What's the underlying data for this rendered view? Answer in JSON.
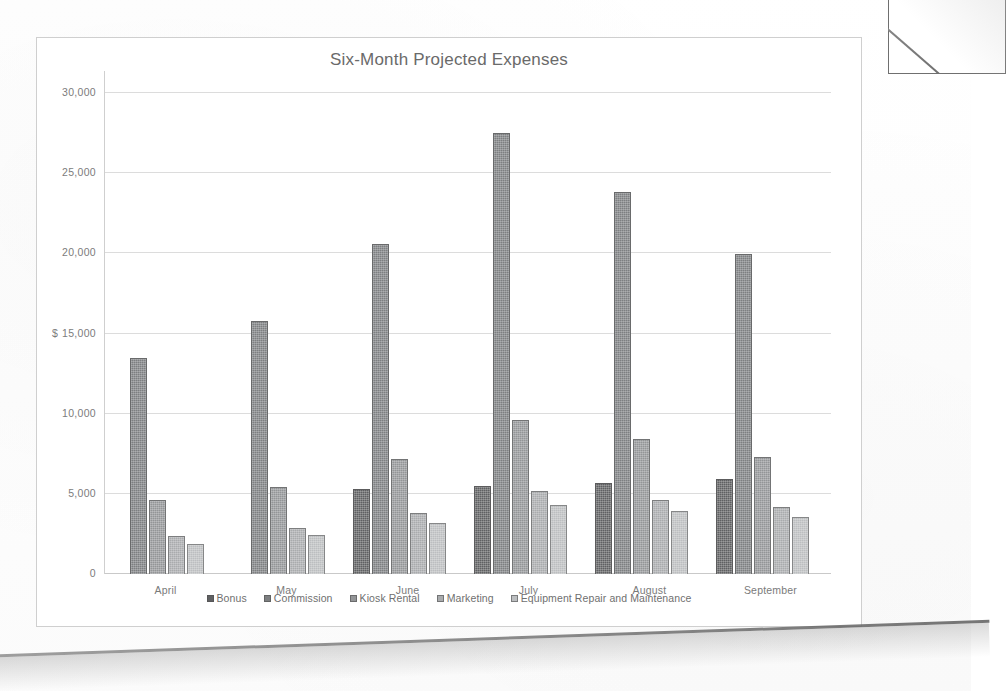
{
  "chart_data": {
    "type": "bar",
    "title": "Six-Month Projected Expenses",
    "xlabel": "",
    "ylabel": "$",
    "ylim": [
      0,
      30000
    ],
    "grid": true,
    "legend_position": "bottom",
    "categories": [
      "April",
      "May",
      "June",
      "July",
      "August",
      "September"
    ],
    "ytick_labels": [
      "0",
      "5,000",
      "10,000",
      "15,000",
      "20,000",
      "25,000",
      "30,000"
    ],
    "ytick_values": [
      0,
      5000,
      10000,
      15000,
      20000,
      25000,
      30000
    ],
    "currency_tick_label": "15,000",
    "currency_symbol": "$",
    "series": [
      {
        "name": "Bonus",
        "values": [
          0,
          0,
          5300,
          5500,
          5700,
          5900
        ]
      },
      {
        "name": "Commission",
        "values": [
          13500,
          15800,
          20600,
          27500,
          23800,
          19950
        ]
      },
      {
        "name": "Kiosk Rental",
        "values": [
          4600,
          5400,
          7150,
          9600,
          8400,
          7300
        ]
      },
      {
        "name": "Marketing",
        "values": [
          2400,
          2900,
          3800,
          5150,
          4600,
          4150
        ]
      },
      {
        "name": "Equipment Repair and Maintenance",
        "values": [
          1900,
          2450,
          3200,
          4300,
          3900,
          3550
        ]
      }
    ],
    "colors": [
      "#5f6062",
      "#7d7f81",
      "#939597",
      "#a9abad",
      "#bcbec0"
    ]
  },
  "legend": {
    "items": [
      {
        "label": "Bonus"
      },
      {
        "label": "Commission"
      },
      {
        "label": "Kiosk Rental"
      },
      {
        "label": "Marketing"
      },
      {
        "label": "Equipment Repair and Maintenance"
      }
    ]
  }
}
